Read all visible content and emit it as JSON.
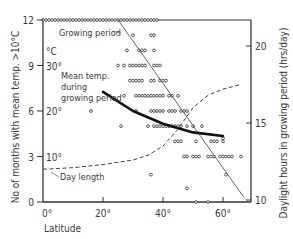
{
  "chart_data": {
    "type": "scatter",
    "title": "",
    "xlabel": "Latitude",
    "ylabel_left": "No of months with mean temp. >10°C",
    "ylabel_right": "Daylight hours in growing period (hrs/day)",
    "xlim": [
      0,
      69
    ],
    "ylim_left": [
      0,
      12
    ],
    "ylim_right": [
      10,
      23
    ],
    "x_ticks": [
      {
        "value": 0,
        "label": "0°"
      },
      {
        "value": 20,
        "label": "20°"
      },
      {
        "value": 40,
        "label": "40°"
      },
      {
        "value": 60,
        "label": "60°"
      }
    ],
    "y_ticks_left": [
      {
        "value": 0,
        "label": "0"
      },
      {
        "value": 3,
        "label": "3",
        "temp_label": "10°"
      },
      {
        "value": 6,
        "label": "6",
        "temp_label": "20°"
      },
      {
        "value": 9,
        "label": "9",
        "temp_label": "30°"
      },
      {
        "value": 12,
        "label": "12"
      }
    ],
    "temp_unit_label": "°C",
    "y_ticks_right": [
      {
        "value": 10,
        "label": "10"
      },
      {
        "value": 15,
        "label": "15"
      },
      {
        "value": 20,
        "label": "20"
      }
    ],
    "annotations": [
      {
        "text": "Growing period",
        "x": 18,
        "y": 11.2
      },
      {
        "text": "Mean temp.",
        "x": 6,
        "y": 7.9
      },
      {
        "text": "during",
        "x": 6,
        "y": 7.2
      },
      {
        "text": "growing period",
        "x": 6,
        "y": 6.5
      },
      {
        "text": "Day length",
        "x": 5,
        "y": 1.3
      }
    ],
    "series": [
      {
        "name": "Growing period (observations)",
        "style": "open-circle",
        "points": [
          [
            0,
            12
          ],
          [
            1,
            12
          ],
          [
            2,
            12
          ],
          [
            3,
            12
          ],
          [
            4,
            12
          ],
          [
            5,
            12
          ],
          [
            6,
            12
          ],
          [
            7,
            12
          ],
          [
            8,
            12
          ],
          [
            9,
            12
          ],
          [
            10,
            12
          ],
          [
            11,
            12
          ],
          [
            12,
            12
          ],
          [
            13,
            12
          ],
          [
            14,
            12
          ],
          [
            15,
            12
          ],
          [
            16,
            12
          ],
          [
            17,
            12
          ],
          [
            18,
            12
          ],
          [
            19,
            12
          ],
          [
            20,
            12
          ],
          [
            21,
            12
          ],
          [
            22,
            12
          ],
          [
            23,
            12
          ],
          [
            24,
            12
          ],
          [
            25,
            12
          ],
          [
            26,
            12
          ],
          [
            27,
            12
          ],
          [
            28,
            12
          ],
          [
            29,
            12
          ],
          [
            30,
            12
          ],
          [
            31,
            12
          ],
          [
            32,
            12
          ],
          [
            33,
            12
          ],
          [
            34,
            12
          ],
          [
            35,
            12
          ],
          [
            36,
            12
          ],
          [
            37,
            12
          ],
          [
            38,
            12
          ],
          [
            30,
            11
          ],
          [
            36,
            11
          ],
          [
            37,
            11
          ],
          [
            28,
            10
          ],
          [
            32,
            10
          ],
          [
            33,
            10
          ],
          [
            34,
            10
          ],
          [
            37,
            10
          ],
          [
            25,
            9
          ],
          [
            27,
            9
          ],
          [
            29,
            9
          ],
          [
            30,
            9
          ],
          [
            31,
            9
          ],
          [
            32,
            9
          ],
          [
            33,
            9
          ],
          [
            34,
            9
          ],
          [
            37,
            9
          ],
          [
            38,
            9
          ],
          [
            39,
            9
          ],
          [
            29,
            8
          ],
          [
            30,
            8
          ],
          [
            31,
            8
          ],
          [
            32,
            8
          ],
          [
            33,
            8
          ],
          [
            36,
            8
          ],
          [
            37,
            8
          ],
          [
            39,
            8
          ],
          [
            40,
            8
          ],
          [
            41,
            8
          ],
          [
            27,
            7
          ],
          [
            31,
            7
          ],
          [
            32,
            7
          ],
          [
            33,
            7
          ],
          [
            34,
            7
          ],
          [
            35,
            7
          ],
          [
            36,
            7
          ],
          [
            37,
            7
          ],
          [
            38,
            7
          ],
          [
            39,
            7
          ],
          [
            40,
            7
          ],
          [
            42,
            7
          ],
          [
            43,
            7
          ],
          [
            45,
            7
          ],
          [
            31,
            6
          ],
          [
            36,
            6
          ],
          [
            37,
            6
          ],
          [
            38,
            6
          ],
          [
            39,
            6
          ],
          [
            40,
            6
          ],
          [
            42,
            6
          ],
          [
            43,
            6
          ],
          [
            44,
            6
          ],
          [
            46,
            6
          ],
          [
            47,
            6
          ],
          [
            48,
            6
          ],
          [
            16,
            6
          ],
          [
            26,
            5
          ],
          [
            35,
            5
          ],
          [
            37,
            5
          ],
          [
            38,
            5
          ],
          [
            39,
            5
          ],
          [
            40,
            5
          ],
          [
            41,
            5
          ],
          [
            42,
            5
          ],
          [
            43,
            5
          ],
          [
            44,
            5
          ],
          [
            45,
            5
          ],
          [
            46,
            5
          ],
          [
            48,
            5
          ],
          [
            50,
            5
          ],
          [
            53,
            5
          ],
          [
            44,
            4
          ],
          [
            45,
            4
          ],
          [
            46,
            4
          ],
          [
            51,
            4
          ],
          [
            56,
            4
          ],
          [
            57,
            4
          ],
          [
            58,
            4
          ],
          [
            60,
            4
          ],
          [
            60,
            4.2
          ],
          [
            47,
            3
          ],
          [
            48,
            3
          ],
          [
            50,
            3
          ],
          [
            51,
            3
          ],
          [
            52,
            3
          ],
          [
            55,
            3
          ],
          [
            56,
            3
          ],
          [
            57,
            3
          ],
          [
            59,
            3
          ],
          [
            60,
            3
          ],
          [
            61,
            3
          ],
          [
            62,
            3
          ],
          [
            63,
            3
          ],
          [
            66,
            3
          ],
          [
            36,
            1.8
          ],
          [
            61,
            1.8
          ],
          [
            48,
            0.9
          ],
          [
            51,
            0
          ],
          [
            55,
            0
          ]
        ]
      },
      {
        "name": "Growing period (trend)",
        "style": "thin-line",
        "points": [
          [
            25,
            12
          ],
          [
            67,
            0.3
          ]
        ]
      },
      {
        "name": "Mean temp. during growing period",
        "axis": "left-temp",
        "style": "thick-curve",
        "points": [
          [
            20,
            24.2
          ],
          [
            30,
            20
          ],
          [
            40,
            17.2
          ],
          [
            50,
            15.3
          ],
          [
            60,
            14.5
          ]
        ]
      },
      {
        "name": "Day length",
        "axis": "right",
        "style": "dashed",
        "points": [
          [
            0,
            12.0
          ],
          [
            10,
            12.1
          ],
          [
            20,
            12.3
          ],
          [
            30,
            12.6
          ],
          [
            35,
            12.9
          ],
          [
            40,
            13.5
          ],
          [
            45,
            14.6
          ],
          [
            50,
            16.0
          ],
          [
            55,
            16.8
          ],
          [
            60,
            17.2
          ],
          [
            66,
            17.5
          ]
        ]
      }
    ],
    "grid": false,
    "legend": "none (inline labels)"
  }
}
